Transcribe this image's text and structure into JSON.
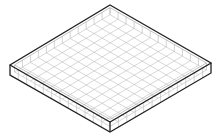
{
  "diagram": {
    "grid_divisions_per_side": 12,
    "colors": {
      "outline": "#222222",
      "grid": "#bdbdbd",
      "wall_divisions": "#b5b5b5",
      "background": "#ffffff"
    }
  }
}
